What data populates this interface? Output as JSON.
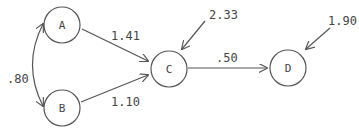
{
  "nodes": [
    {
      "id": "A",
      "label": "A"
    },
    {
      "id": "B",
      "label": "B"
    },
    {
      "id": "C",
      "label": "C"
    },
    {
      "id": "D",
      "label": "D"
    }
  ],
  "edges": [
    {
      "from": "A",
      "to": "C",
      "label": "1.41"
    },
    {
      "from": "B",
      "to": "C",
      "label": "1.10"
    },
    {
      "from": "C",
      "to": "D",
      "label": ".50"
    },
    {
      "from": "A",
      "to": "B",
      "label": ".80",
      "type": "bidirectional-curved"
    }
  ],
  "residuals": [
    {
      "to": "C",
      "label": "2.33"
    },
    {
      "to": "D",
      "label": "1.90"
    }
  ],
  "colors": {
    "stroke": "#555555",
    "text": "#444444",
    "background": "#ffffff"
  }
}
